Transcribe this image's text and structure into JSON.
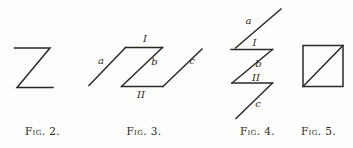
{
  "page": {
    "background": "#fdfdfb",
    "ink": "#2b2926"
  },
  "figures": [
    {
      "caption": "Fig. 2.",
      "labels": {}
    },
    {
      "caption": "Fig. 3.",
      "labels": {
        "a": "a",
        "I": "I",
        "b": "b",
        "II": "II",
        "c": "c"
      }
    },
    {
      "caption": "Fig. 4.",
      "labels": {
        "a": "a",
        "I": "I",
        "b": "b",
        "II": "II",
        "c": "c"
      }
    },
    {
      "caption": "Fig. 5.",
      "labels": {}
    }
  ]
}
